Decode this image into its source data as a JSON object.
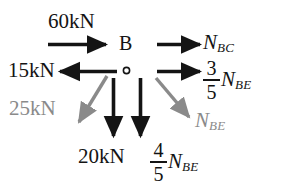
{
  "diagram": {
    "background_color": "#ffffff",
    "black_color": "#141414",
    "gray_color": "#8a8a8a",
    "joint": {
      "label": "B",
      "node_marker": "open-circle"
    },
    "labels": {
      "applied_60kN": "60kN",
      "applied_15kN": "15kN",
      "applied_25kN": "25kN",
      "applied_20kN": "20kN"
    },
    "members": {
      "nbc": {
        "symbol": "N",
        "subscript": "BC"
      },
      "nbe": {
        "symbol": "N",
        "subscript": "BE"
      },
      "nbe_x": {
        "numerator": "3",
        "denominator": "5",
        "symbol": "N",
        "subscript": "BE"
      },
      "nbe_y": {
        "numerator": "4",
        "denominator": "5",
        "symbol": "N",
        "subscript": "BE"
      }
    },
    "forces": [
      {
        "name": "60kN",
        "label": "60kN",
        "direction": "right",
        "color": "#141414",
        "style": "solid"
      },
      {
        "name": "15kN",
        "label": "15kN",
        "direction": "left",
        "color": "#141414",
        "style": "solid"
      },
      {
        "name": "25kN",
        "label": "25kN",
        "direction": "down-left",
        "color": "#8a8a8a",
        "style": "solid"
      },
      {
        "name": "20kN",
        "label": "20kN",
        "direction": "down",
        "color": "#141414",
        "style": "solid"
      },
      {
        "name": "NBC",
        "label": "N_BC",
        "direction": "right",
        "color": "#141414",
        "style": "solid"
      },
      {
        "name": "NBE-x-component",
        "label": "3/5 N_BE",
        "direction": "right",
        "color": "#141414",
        "style": "solid"
      },
      {
        "name": "NBE-y-component",
        "label": "4/5 N_BE",
        "direction": "down",
        "color": "#141414",
        "style": "solid"
      },
      {
        "name": "NBE-resultant",
        "label": "N_BE",
        "direction": "down-right",
        "color": "#8a8a8a",
        "style": "solid"
      }
    ]
  }
}
